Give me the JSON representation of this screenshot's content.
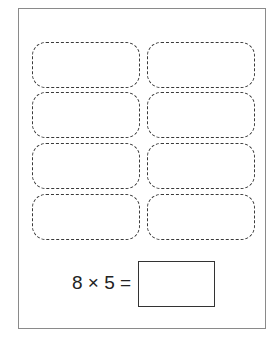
{
  "worksheet": {
    "slots": [
      {
        "row": 1,
        "col": 1
      },
      {
        "row": 1,
        "col": 2
      },
      {
        "row": 2,
        "col": 1
      },
      {
        "row": 2,
        "col": 2
      },
      {
        "row": 3,
        "col": 1
      },
      {
        "row": 3,
        "col": 2
      },
      {
        "row": 4,
        "col": 1
      },
      {
        "row": 4,
        "col": 2
      }
    ],
    "equation": {
      "text": "8 × 5 =",
      "factor_a": 8,
      "factor_b": 5,
      "operator": "×",
      "answer": ""
    }
  }
}
